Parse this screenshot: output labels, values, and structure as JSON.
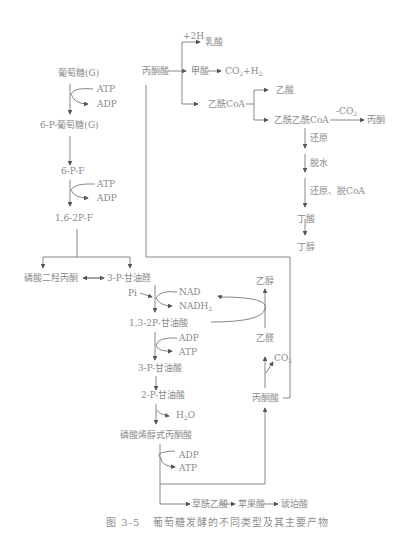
{
  "figure": {
    "caption_number": "图 3-5",
    "caption_text": "葡萄糖发酵的不同类型及其主要产物"
  },
  "glycolysis": {
    "glucose": "葡萄糖(G)",
    "atp1": "ATP",
    "adp1": "ADP",
    "g6p": "6-P-葡萄糖(G)",
    "f6p": "6-P-F",
    "atp2": "ATP",
    "adp2": "ADP",
    "f16bp": "1,6-2P-F",
    "dhap": "磷酸二羟丙酮",
    "g3p": "3-P-甘油醛",
    "pi": "Pi",
    "nad": "NAD",
    "nadh2": "NADH",
    "nadh2_sub": "2",
    "bpg": "1,3-2P-甘油酸",
    "adp3": "ADP",
    "atp3": "ATP",
    "pg3": "3-P-甘油酸",
    "pg2": "2-P-甘油酸",
    "h2o": "H",
    "h2o_sub": "2",
    "h2o_tail": "O",
    "pep": "磷酸烯醇式丙酮酸",
    "adp4": "ADP",
    "atp4": "ATP"
  },
  "pyruvate_branch": {
    "pyruvate": "丙酮酸",
    "plus2h": "+2H",
    "lactate": "乳酸",
    "formate": "甲酸",
    "co2h2_a": "CO",
    "co2h2_sub1": "2",
    "co2h2_b": "+H",
    "co2h2_sub2": "2",
    "acetyl_coa": "乙酰CoA",
    "acetate": "乙酸",
    "acetoacetyl_coa": "乙酰乙酰CoA",
    "minus_co2": "-CO",
    "minus_co2_sub": "2",
    "acetone": "丙酮",
    "step_reduce": "还原",
    "step_dehydrate": "脱水",
    "step_reduce_decoa": "还原、脱CoA",
    "butyrate": "丁酸",
    "butanol": "丁醇"
  },
  "ethanol_branch": {
    "ethanol": "乙醇",
    "acetaldehyde": "乙醛",
    "co2": "CO",
    "co2_sub": "2",
    "pyruvate": "丙酮酸"
  },
  "succinate_branch": {
    "oxaloacetate": "草酰乙酸",
    "malate": "苹果酸",
    "succinate": "琥珀酸"
  }
}
